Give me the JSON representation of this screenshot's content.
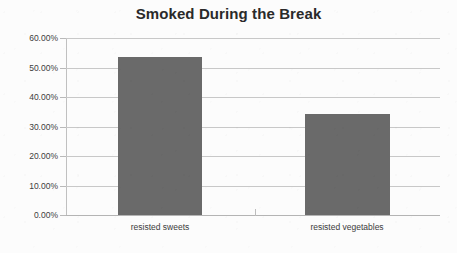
{
  "chart_data": {
    "type": "bar",
    "title": "Smoked During the Break",
    "xlabel": "",
    "ylabel": "",
    "categories": [
      "resisted sweets",
      "resisted vegetables"
    ],
    "values": [
      53.5,
      34.2
    ],
    "value_labels": [
      "53.50%",
      "34.20%"
    ],
    "ylim": [
      0,
      60
    ],
    "ytick_values": [
      0,
      10,
      20,
      30,
      40,
      50,
      60
    ],
    "ytick_labels": [
      "0.00%",
      "10.00%",
      "20.00%",
      "30.00%",
      "40.00%",
      "50.00%",
      "60.00%"
    ],
    "grid": true,
    "legend": false,
    "bar_color": "#6a6a6a",
    "gridline_color": "#c8c8c8",
    "background_color": "#fcfcfc",
    "title_color": "#2a2a2a"
  }
}
